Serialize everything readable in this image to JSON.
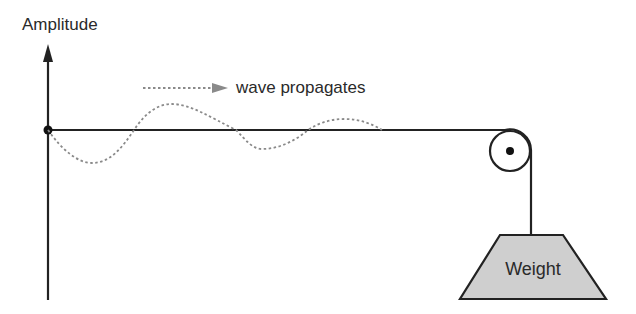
{
  "diagram": {
    "axis_label": "Amplitude",
    "wave_label": "wave propagates",
    "weight_label": "Weight",
    "colors": {
      "line": "#222222",
      "wave": "#8a8a8a",
      "weight_fill": "#cfcfcf",
      "text": "#2a2a2a"
    },
    "components": [
      "amplitude-axis",
      "string",
      "transverse-wave",
      "propagation-arrow",
      "pulley",
      "hanging-weight"
    ]
  }
}
